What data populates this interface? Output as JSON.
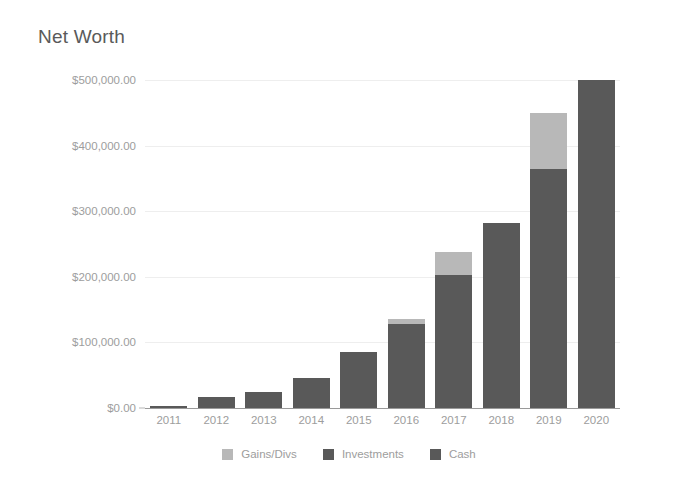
{
  "chart_data": {
    "type": "bar",
    "title": "Net Worth",
    "subtitle": "",
    "xlabel": "",
    "ylabel": "",
    "stacked": true,
    "grid": true,
    "legend_position": "bottom",
    "ylim": [
      0,
      500000
    ],
    "ytick_labels": [
      "$500,000.00",
      "$400,000.00",
      "$300,000.00",
      "$200,000.00",
      "$100,000.00",
      "$0.00"
    ],
    "ytick_values": [
      500000,
      400000,
      300000,
      200000,
      100000,
      0
    ],
    "categories": [
      "2011",
      "2012",
      "2013",
      "2014",
      "2015",
      "2016",
      "2017",
      "2018",
      "2019",
      "2020"
    ],
    "series": [
      {
        "name": "Cash",
        "color": "#595959",
        "values": [
          3000,
          17000,
          25000,
          46000,
          85000,
          128000,
          203000,
          282000,
          365000,
          500000
        ]
      },
      {
        "name": "Investments",
        "color": "#595959",
        "values": [
          0,
          0,
          0,
          0,
          0,
          0,
          0,
          0,
          0,
          0
        ]
      },
      {
        "name": "Gains/Divs",
        "color": "#b8b8b8",
        "values": [
          0,
          0,
          0,
          0,
          0,
          7000,
          35000,
          0,
          85000,
          0
        ]
      }
    ],
    "totals": [
      3000,
      17000,
      25000,
      46000,
      85000,
      135000,
      238000,
      282000,
      450000,
      500000
    ]
  },
  "legend": {
    "items": [
      {
        "label": "Gains/Divs",
        "color": "#b8b8b8"
      },
      {
        "label": "Investments",
        "color": "#595959"
      },
      {
        "label": "Cash",
        "color": "#595959"
      }
    ]
  },
  "colors": {
    "gains": "#b8b8b8",
    "investments": "#595959",
    "cash": "#595959",
    "grid": "#eeeeee",
    "axis": "#9a9a9a",
    "tick_text": "#9d9d9d",
    "title_text": "#5a5a5a",
    "background": "#ffffff"
  }
}
